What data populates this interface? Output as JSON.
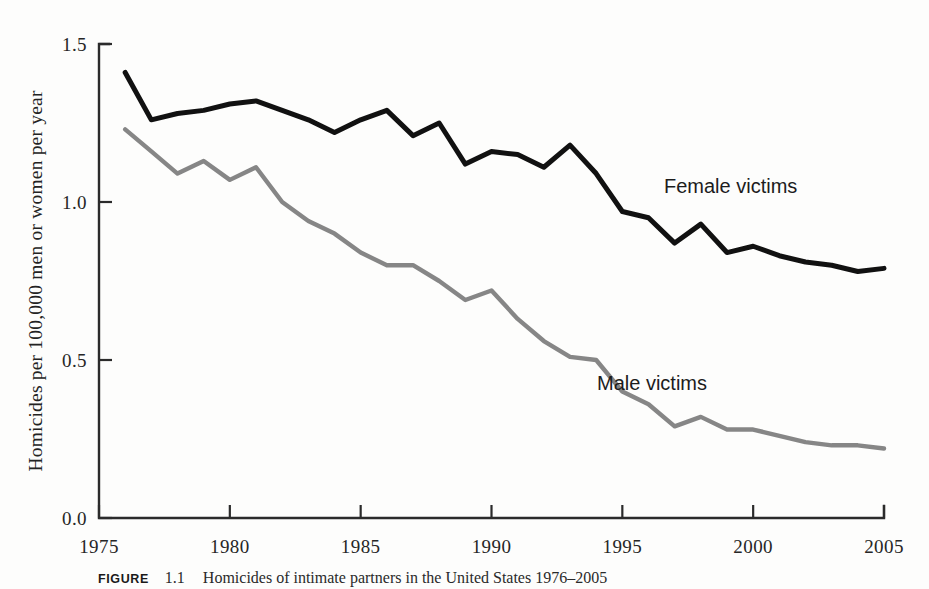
{
  "figure": {
    "caption_label": "FIGURE",
    "caption_number": "1.1",
    "caption_text": "Homicides of intimate partners in the United States 1976–2005"
  },
  "axes": {
    "y_title": "Homicides per 100,000 men or women per year",
    "y_ticks": [
      "0.0",
      "0.5",
      "1.0",
      "1.5"
    ],
    "x_ticks": [
      "1975",
      "1980",
      "1985",
      "1990",
      "1995",
      "2000",
      "2005"
    ]
  },
  "annotations": {
    "female_label": "Female victims",
    "male_label": "Male victims"
  },
  "colors": {
    "female_line": "#111111",
    "male_line": "#868686",
    "axis": "#2b2b2b",
    "background": "#fdfdfc"
  },
  "chart_data": {
    "type": "line",
    "title": "Homicides of intimate partners in the United States 1976–2005",
    "xlabel": "",
    "ylabel": "Homicides per 100,000 men or women per year",
    "xlim": [
      1975,
      2005
    ],
    "ylim": [
      0.0,
      1.5
    ],
    "xticks": [
      1975,
      1980,
      1985,
      1990,
      1995,
      2000,
      2005
    ],
    "yticks": [
      0.0,
      0.5,
      1.0,
      1.5
    ],
    "grid": false,
    "legend": "inline-annotations",
    "x": [
      1976,
      1977,
      1978,
      1979,
      1980,
      1981,
      1982,
      1983,
      1984,
      1985,
      1986,
      1987,
      1988,
      1989,
      1990,
      1991,
      1992,
      1993,
      1994,
      1995,
      1996,
      1997,
      1998,
      1999,
      2000,
      2001,
      2002,
      2003,
      2004,
      2005
    ],
    "series": [
      {
        "name": "Female victims",
        "color": "#111111",
        "values": [
          1.41,
          1.26,
          1.28,
          1.29,
          1.31,
          1.32,
          1.29,
          1.26,
          1.22,
          1.26,
          1.29,
          1.21,
          1.25,
          1.12,
          1.16,
          1.15,
          1.11,
          1.18,
          1.09,
          0.97,
          0.95,
          0.87,
          0.93,
          0.84,
          0.86,
          0.83,
          0.81,
          0.8,
          0.78,
          0.79
        ]
      },
      {
        "name": "Male victims",
        "color": "#868686",
        "values": [
          1.23,
          1.16,
          1.09,
          1.13,
          1.07,
          1.11,
          1.0,
          0.94,
          0.9,
          0.84,
          0.8,
          0.8,
          0.75,
          0.69,
          0.72,
          0.63,
          0.56,
          0.51,
          0.5,
          0.4,
          0.36,
          0.29,
          0.32,
          0.28,
          0.28,
          0.26,
          0.24,
          0.23,
          0.23,
          0.22
        ]
      }
    ]
  }
}
